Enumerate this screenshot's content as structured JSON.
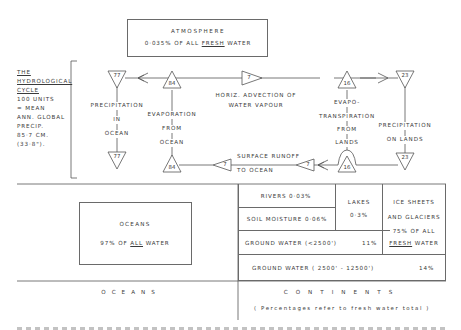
{
  "atmosphere": {
    "title": "ATMOSPHERE",
    "subtitle_prefix": "0·035% OF ALL ",
    "subtitle_emph": "FRESH",
    "subtitle_suffix": " WATER"
  },
  "legend": {
    "line1": "THE",
    "line2": "HYDROLOGICAL",
    "line3": "CYCLE",
    "line4": "100 UNITS",
    "line5": "= MEAN",
    "line6": "ANN. GLOBAL",
    "line7": "PRECIP.",
    "line8": "85·7 CM.",
    "line9": "(33·8\")."
  },
  "flows": {
    "precip_ocean": {
      "value_top": "77",
      "value_bottom": "77",
      "label": [
        "PRECIPITATION",
        "IN",
        "OCEAN"
      ]
    },
    "evap_ocean": {
      "value_top": "84",
      "value_bottom": "84",
      "label": [
        "EVAPORATION",
        "FROM",
        "OCEAN"
      ]
    },
    "advection": {
      "value": "7",
      "label": [
        "HORIZ. ADVECTION OF",
        "WATER VAPOUR"
      ]
    },
    "evapotranspiration": {
      "value_top": "16",
      "value_bottom": "16",
      "label": [
        "EVAPO-",
        "TRANSPIRATION",
        "FROM",
        "LANDS"
      ]
    },
    "precip_lands": {
      "value_top": "23",
      "value_bottom": "23",
      "label": [
        "PRECIPITATION",
        "ON LANDS"
      ]
    },
    "runoff": {
      "value_left": "7",
      "value_right": "7",
      "label": [
        "SURFACE RUNOFF",
        "TO OCEAN"
      ]
    }
  },
  "oceans_box": {
    "title": "OCEANS",
    "subtitle_prefix": "97% OF ",
    "subtitle_emph": "ALL",
    "subtitle_suffix": " WATER"
  },
  "continents_table": {
    "rivers": "RIVERS 0·03%",
    "soil_moisture": "SOIL MOISTURE 0·06%",
    "lakes_label": "LAKES",
    "lakes_value": "0·3%",
    "ice_line1": "ICE SHEETS",
    "ice_line2": "AND GLACIERS",
    "ice_line3": "75% OF ALL",
    "ice_line4_emph": "FRESH",
    "ice_line4_suffix": " WATER",
    "ground_shallow_label": "GROUND WATER (<2500')",
    "ground_shallow_value": "11%",
    "ground_deep_label": "GROUND WATER ( 2500' - 12500')",
    "ground_deep_value": "14%"
  },
  "footer": {
    "oceans": "OCEANS",
    "continents": "CONTINENTS",
    "note": "( Percentages refer to fresh water total )"
  }
}
